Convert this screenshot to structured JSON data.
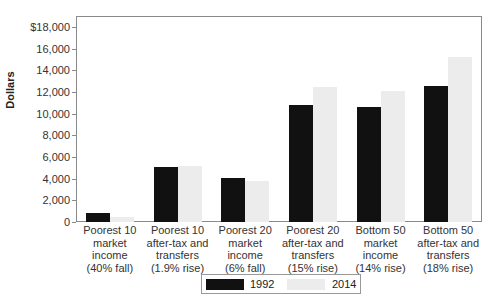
{
  "chart_data": {
    "type": "bar",
    "title": "",
    "xlabel": "",
    "ylabel": "Dollars",
    "ylim": [
      0,
      18000
    ],
    "yticks": [
      "0",
      "2,000",
      "4,000",
      "6,000",
      "8,000",
      "10,000",
      "12,000",
      "14,000",
      "16,000",
      "$18,000"
    ],
    "grid": false,
    "legend_position": "bottom",
    "categories": [
      "Poorest 10\nmarket\nincome\n(40% fall)",
      "Poorest 10\nafter-tax and\ntransfers\n(1.9% rise)",
      "Poorest 20\nmarket\nincome\n(6% fall)",
      "Poorest 20\nafter-tax and\ntransfers\n(15% rise)",
      "Bottom 50\nmarket\nincome\n(14% rise)",
      "Bottom 50\nafter-tax and\ntransfers\n(18% rise)"
    ],
    "series": [
      {
        "name": "1992",
        "color": "#111111",
        "values": [
          800,
          5050,
          4050,
          10800,
          10600,
          12550
        ]
      },
      {
        "name": "2014",
        "color": "#ececec",
        "values": [
          480,
          5150,
          3800,
          12450,
          12100,
          15250
        ]
      }
    ]
  }
}
